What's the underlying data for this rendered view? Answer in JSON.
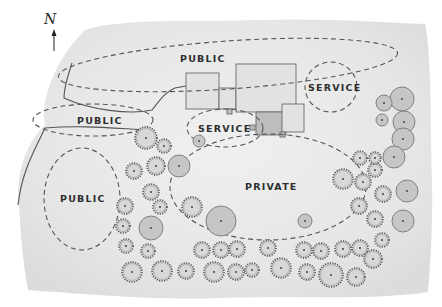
{
  "diagram": {
    "type": "site-plan-bubble-diagram",
    "north_label": "N",
    "colors": {
      "paper": "#ececec",
      "paper_edge": "#f6f6f6",
      "outline": "#555555",
      "building_light": "#e2e2e2",
      "building_dark": "#bdbdbd",
      "tree_fill": "#c6c6c6",
      "shrub_fill": "#d8d8d8",
      "text": "#2e2e2e"
    },
    "zones": [
      {
        "id": "public-north",
        "label": "PUBLIC",
        "cx": 228,
        "cy": 65,
        "rx": 170,
        "ry": 24,
        "rot": -4,
        "label_x": 180,
        "label_y": 62
      },
      {
        "id": "public-west",
        "label": "PUBLIC",
        "cx": 93,
        "cy": 120,
        "rx": 60,
        "ry": 16,
        "rot": 0,
        "label_x": 77,
        "label_y": 124
      },
      {
        "id": "public-southwest",
        "label": "PUBLIC",
        "cx": 82,
        "cy": 199,
        "rx": 38,
        "ry": 51,
        "rot": 0,
        "label_x": 60,
        "label_y": 202
      },
      {
        "id": "service-east",
        "label": "SERVICE",
        "cx": 331,
        "cy": 87,
        "rx": 26,
        "ry": 25,
        "rot": 0,
        "label_x": 308,
        "label_y": 91
      },
      {
        "id": "service-center",
        "label": "SERVICE",
        "cx": 225,
        "cy": 128,
        "rx": 38,
        "ry": 19,
        "rot": 0,
        "label_x": 198,
        "label_y": 132
      },
      {
        "id": "private",
        "label": "PRIVATE",
        "cx": 268,
        "cy": 187,
        "rx": 98,
        "ry": 53,
        "rot": 0,
        "label_x": 245,
        "label_y": 190
      }
    ],
    "buildings": [
      {
        "x": 186,
        "y": 73,
        "w": 33,
        "h": 36,
        "shade": "light"
      },
      {
        "x": 219,
        "y": 88,
        "w": 17,
        "h": 21,
        "shade": "light"
      },
      {
        "x": 236,
        "y": 64,
        "w": 60,
        "h": 48,
        "shade": "light"
      },
      {
        "x": 256,
        "y": 112,
        "w": 30,
        "h": 23,
        "shade": "dark"
      },
      {
        "x": 282,
        "y": 104,
        "w": 22,
        "h": 28,
        "shade": "light"
      },
      {
        "x": 227,
        "y": 109,
        "w": 5,
        "h": 5,
        "shade": "dark"
      },
      {
        "x": 280,
        "y": 132,
        "w": 5,
        "h": 5,
        "shade": "dark"
      },
      {
        "x": 250,
        "y": 125,
        "w": 5,
        "h": 5,
        "shade": "dark"
      }
    ],
    "trees": [
      {
        "x": 402,
        "y": 99,
        "r": 12,
        "kind": "canopy"
      },
      {
        "x": 384,
        "y": 103,
        "r": 8,
        "kind": "canopy"
      },
      {
        "x": 382,
        "y": 120,
        "r": 6,
        "kind": "canopy"
      },
      {
        "x": 404,
        "y": 122,
        "r": 11,
        "kind": "canopy"
      },
      {
        "x": 403,
        "y": 139,
        "r": 11,
        "kind": "canopy"
      },
      {
        "x": 394,
        "y": 157,
        "r": 11,
        "kind": "canopy"
      },
      {
        "x": 407,
        "y": 191,
        "r": 11,
        "kind": "canopy"
      },
      {
        "x": 403,
        "y": 221,
        "r": 11,
        "kind": "canopy"
      },
      {
        "x": 221,
        "y": 221,
        "r": 15,
        "kind": "canopy"
      },
      {
        "x": 151,
        "y": 228,
        "r": 12,
        "kind": "canopy"
      },
      {
        "x": 179,
        "y": 166,
        "r": 11,
        "kind": "canopy"
      },
      {
        "x": 199,
        "y": 141,
        "r": 6,
        "kind": "canopy"
      },
      {
        "x": 305,
        "y": 221,
        "r": 7,
        "kind": "canopy"
      },
      {
        "x": 146,
        "y": 138,
        "r": 11,
        "kind": "shrub"
      },
      {
        "x": 164,
        "y": 146,
        "r": 7,
        "kind": "shrub"
      },
      {
        "x": 156,
        "y": 166,
        "r": 9,
        "kind": "shrub"
      },
      {
        "x": 134,
        "y": 171,
        "r": 8,
        "kind": "shrub"
      },
      {
        "x": 151,
        "y": 192,
        "r": 8,
        "kind": "shrub"
      },
      {
        "x": 125,
        "y": 206,
        "r": 8,
        "kind": "shrub"
      },
      {
        "x": 160,
        "y": 207,
        "r": 7,
        "kind": "shrub"
      },
      {
        "x": 192,
        "y": 207,
        "r": 10,
        "kind": "shrub"
      },
      {
        "x": 123,
        "y": 226,
        "r": 7,
        "kind": "shrub"
      },
      {
        "x": 126,
        "y": 246,
        "r": 7,
        "kind": "shrub"
      },
      {
        "x": 148,
        "y": 251,
        "r": 7,
        "kind": "shrub"
      },
      {
        "x": 132,
        "y": 272,
        "r": 10,
        "kind": "shrub"
      },
      {
        "x": 162,
        "y": 271,
        "r": 10,
        "kind": "shrub"
      },
      {
        "x": 186,
        "y": 271,
        "r": 8,
        "kind": "shrub"
      },
      {
        "x": 202,
        "y": 250,
        "r": 8,
        "kind": "shrub"
      },
      {
        "x": 221,
        "y": 250,
        "r": 8,
        "kind": "shrub"
      },
      {
        "x": 237,
        "y": 249,
        "r": 8,
        "kind": "shrub"
      },
      {
        "x": 268,
        "y": 248,
        "r": 8,
        "kind": "shrub"
      },
      {
        "x": 214,
        "y": 272,
        "r": 10,
        "kind": "shrub"
      },
      {
        "x": 236,
        "y": 272,
        "r": 8,
        "kind": "shrub"
      },
      {
        "x": 252,
        "y": 270,
        "r": 7,
        "kind": "shrub"
      },
      {
        "x": 281,
        "y": 268,
        "r": 10,
        "kind": "shrub"
      },
      {
        "x": 307,
        "y": 272,
        "r": 8,
        "kind": "shrub"
      },
      {
        "x": 331,
        "y": 275,
        "r": 12,
        "kind": "shrub"
      },
      {
        "x": 356,
        "y": 277,
        "r": 9,
        "kind": "shrub"
      },
      {
        "x": 321,
        "y": 251,
        "r": 8,
        "kind": "shrub"
      },
      {
        "x": 304,
        "y": 250,
        "r": 8,
        "kind": "shrub"
      },
      {
        "x": 343,
        "y": 249,
        "r": 8,
        "kind": "shrub"
      },
      {
        "x": 360,
        "y": 248,
        "r": 8,
        "kind": "shrub"
      },
      {
        "x": 373,
        "y": 259,
        "r": 9,
        "kind": "shrub"
      },
      {
        "x": 375,
        "y": 219,
        "r": 8,
        "kind": "shrub"
      },
      {
        "x": 383,
        "y": 194,
        "r": 8,
        "kind": "shrub"
      },
      {
        "x": 359,
        "y": 206,
        "r": 8,
        "kind": "shrub"
      },
      {
        "x": 363,
        "y": 182,
        "r": 8,
        "kind": "shrub"
      },
      {
        "x": 343,
        "y": 179,
        "r": 10,
        "kind": "shrub"
      },
      {
        "x": 375,
        "y": 170,
        "r": 7,
        "kind": "shrub"
      },
      {
        "x": 375,
        "y": 158,
        "r": 6,
        "kind": "shrub"
      },
      {
        "x": 382,
        "y": 240,
        "r": 7,
        "kind": "shrub"
      },
      {
        "x": 360,
        "y": 158,
        "r": 7,
        "kind": "shrub"
      }
    ]
  }
}
